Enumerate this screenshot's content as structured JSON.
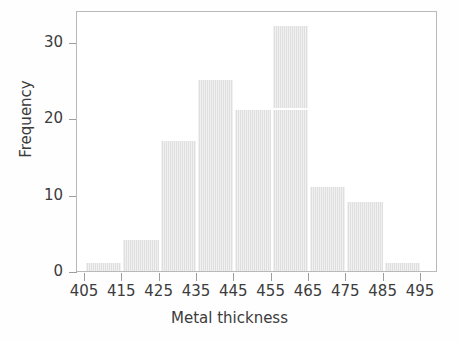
{
  "chart_data": {
    "type": "bar",
    "title": "",
    "subtitle": "",
    "xlabel": "Metal thickness",
    "ylabel": "Frequency",
    "bin_edges": [
      405,
      415,
      425,
      435,
      445,
      455,
      465,
      475,
      485,
      495
    ],
    "bin_width": 10,
    "categories": [
      "405-415",
      "415-425",
      "425-435",
      "435-445",
      "445-455",
      "455-465",
      "465-475",
      "475-485",
      "485-495"
    ],
    "values": [
      1,
      4,
      17,
      25,
      21,
      32,
      11,
      9,
      1
    ],
    "bar_tops_frequency": [
      1,
      4,
      17,
      25,
      21,
      32,
      11,
      9,
      1
    ],
    "total_count": 121,
    "xlim": [
      405,
      495
    ],
    "ylim": [
      0,
      33
    ],
    "xticks": [
      405,
      415,
      425,
      435,
      445,
      455,
      465,
      475,
      485,
      495
    ],
    "xtick_labels": [
      "405",
      "415",
      "425",
      "435",
      "445",
      "455",
      "465",
      "475",
      "485",
      "495"
    ],
    "yticks": [
      0,
      10,
      20,
      30
    ],
    "ytick_labels": [
      "0",
      "10",
      "20",
      "30"
    ],
    "grid": false,
    "legend": null,
    "legend_position": "none",
    "annotations": [
      {
        "kind": "white-scanline-artifact",
        "x_range": [
          445,
          465
        ],
        "y_value": 21
      }
    ],
    "colors": {
      "bar_fill": "#dfdfdf",
      "bar_edge": "#dfdfdf",
      "axis": "#9e9e9e",
      "frame": "#b9b9b9",
      "text": "#3c3c3c",
      "background": "#ffffff"
    }
  }
}
